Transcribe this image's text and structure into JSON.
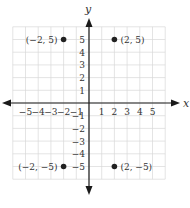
{
  "chart_data": {
    "type": "scatter",
    "title": "",
    "xlabel": "x",
    "ylabel": "y",
    "xlim": [
      -6,
      6
    ],
    "ylim": [
      -6,
      6
    ],
    "grid": true,
    "x_ticks": [
      -5,
      -4,
      -3,
      -2,
      -1,
      1,
      2,
      3,
      4,
      5
    ],
    "y_ticks": [
      5,
      4,
      3,
      2,
      1,
      -1,
      -2,
      -3,
      -4,
      -5
    ],
    "x_tick_labels": [
      "−5",
      "−4",
      "−3",
      "−2",
      "−1",
      "1",
      "2",
      "3",
      "4",
      "5"
    ],
    "y_tick_labels": [
      "5",
      "4",
      "3",
      "2",
      "1",
      "−1",
      "−2",
      "−3",
      "−4",
      "−5"
    ],
    "points": [
      {
        "x": -2,
        "y": 5,
        "label": "(−2, 5)",
        "label_side": "left"
      },
      {
        "x": 2,
        "y": 5,
        "label": "(2, 5)",
        "label_side": "right"
      },
      {
        "x": -2,
        "y": -5,
        "label": "(−2, −5)",
        "label_side": "left"
      },
      {
        "x": 2,
        "y": -5,
        "label": "(2, −5)",
        "label_side": "right"
      }
    ],
    "colors": {
      "grid": "#d9d9d9",
      "axis": "#1a1a1a",
      "point": "#222222",
      "text": "#333333"
    }
  }
}
